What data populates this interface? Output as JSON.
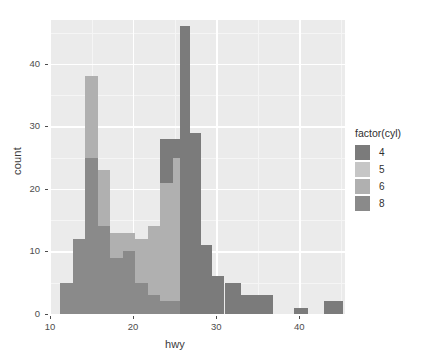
{
  "chart_data": {
    "type": "bar",
    "subtype": "stacked-histogram",
    "title": "",
    "xlabel": "hwy",
    "ylabel": "count",
    "xlim": [
      10.0,
      45.5
    ],
    "ylim": [
      0,
      47
    ],
    "xticks": [
      10,
      20,
      30,
      40
    ],
    "yticks": [
      0,
      10,
      20,
      30,
      40
    ],
    "grid": true,
    "legend": {
      "title": "factor(cyl)",
      "position": "right",
      "entries": [
        {
          "label": "4",
          "color": "#7b7b7b"
        },
        {
          "label": "5",
          "color": "#c6c6c6"
        },
        {
          "label": "6",
          "color": "#b0b0b0"
        },
        {
          "label": "8",
          "color": "#8a8a8a"
        }
      ]
    },
    "binwidth": 1.5,
    "bins": [
      {
        "x0": 11.25,
        "x1": 12.75,
        "values": {
          "4": 0,
          "5": 0,
          "6": 0,
          "8": 5
        }
      },
      {
        "x0": 12.75,
        "x1": 14.25,
        "values": {
          "4": 0,
          "5": 0,
          "6": 0,
          "8": 12
        }
      },
      {
        "x0": 14.25,
        "x1": 15.75,
        "values": {
          "4": 0,
          "5": 0,
          "6": 0,
          "8": 25
        }
      },
      {
        "x0": 15.75,
        "x1": 17.25,
        "values": {
          "4": 0,
          "5": 0,
          "6": 13,
          "8": 25
        }
      },
      {
        "x0": 17.25,
        "x1": 18.75,
        "values": {
          "4": 0,
          "5": 0,
          "6": 9,
          "8": 14
        }
      },
      {
        "x0": 18.75,
        "x1": 20.25,
        "values": {
          "4": 0,
          "5": 0,
          "6": 10,
          "8": 4
        }
      },
      {
        "x0": 20.25,
        "x1": 21.75,
        "values": {
          "4": 0,
          "5": 0,
          "6": 9,
          "8": 4
        }
      },
      {
        "x0": 21.75,
        "x1": 23.25,
        "values": {
          "4": 0,
          "5": 0,
          "6": 9,
          "8": 5
        }
      },
      {
        "x0": 23.25,
        "x1": 24.75,
        "values": {
          "4": 0,
          "5": 0,
          "6": 11,
          "8": 3
        }
      },
      {
        "x0": 24.75,
        "x1": 26.25,
        "values": {
          "4": 0,
          "5": 0,
          "6": 19,
          "8": 2
        }
      },
      {
        "x0": 25.6,
        "x1": 26.9,
        "values": {
          "4": 46,
          "5": 0,
          "6": 0,
          "8": 0
        }
      },
      {
        "x0": 26.25,
        "x1": 27.75,
        "values": {
          "4": 0,
          "5": 0,
          "6": 23,
          "8": 2
        }
      },
      {
        "x0": 27.75,
        "x1": 29.25,
        "values": {
          "4": 0,
          "5": 0,
          "6": 8,
          "8": 0
        }
      },
      {
        "x0": 29.25,
        "x1": 30.75,
        "values": {
          "4": 0,
          "5": 0,
          "6": 6,
          "8": 0
        }
      },
      {
        "x0": 30.75,
        "x1": 32.25,
        "values": {
          "4": 0,
          "5": 0,
          "6": 5,
          "8": 0
        }
      },
      {
        "x0": 32.25,
        "x1": 33.75,
        "values": {
          "4": 0,
          "5": 0,
          "6": 3,
          "8": 0
        }
      },
      {
        "x0": 33.75,
        "x1": 36.75,
        "values": {
          "4": 0,
          "5": 0,
          "6": 3,
          "8": 0
        }
      },
      {
        "x0": 39.4,
        "x1": 41.0,
        "values": {
          "4": 1,
          "5": 0,
          "6": 0,
          "8": 0
        }
      },
      {
        "x0": 43.0,
        "x1": 45.0,
        "values": {
          "4": 2,
          "5": 0,
          "6": 0,
          "8": 0
        }
      }
    ],
    "visual_bars": [
      {
        "x0": 11.25,
        "x1": 12.75,
        "bottom": 0,
        "top": 5,
        "series": "8"
      },
      {
        "x0": 12.75,
        "x1": 14.25,
        "bottom": 0,
        "top": 12,
        "series": "8"
      },
      {
        "x0": 14.25,
        "x1": 15.75,
        "bottom": 0,
        "top": 25,
        "series": "8"
      },
      {
        "x0": 14.25,
        "x1": 15.75,
        "bottom": 25,
        "top": 38,
        "series": "6"
      },
      {
        "x0": 15.75,
        "x1": 17.25,
        "bottom": 0,
        "top": 14,
        "series": "8"
      },
      {
        "x0": 15.75,
        "x1": 17.25,
        "bottom": 14,
        "top": 23,
        "series": "6"
      },
      {
        "x0": 17.25,
        "x1": 18.75,
        "bottom": 0,
        "top": 9,
        "series": "8"
      },
      {
        "x0": 17.25,
        "x1": 18.75,
        "bottom": 9,
        "top": 13,
        "series": "6"
      },
      {
        "x0": 18.75,
        "x1": 20.25,
        "bottom": 0,
        "top": 10,
        "series": "8"
      },
      {
        "x0": 18.75,
        "x1": 20.25,
        "bottom": 10,
        "top": 13,
        "series": "6"
      },
      {
        "x0": 20.25,
        "x1": 21.75,
        "bottom": 0,
        "top": 5,
        "series": "8"
      },
      {
        "x0": 20.25,
        "x1": 21.75,
        "bottom": 5,
        "top": 12,
        "series": "6"
      },
      {
        "x0": 21.75,
        "x1": 23.25,
        "bottom": 0,
        "top": 3,
        "series": "8"
      },
      {
        "x0": 21.75,
        "x1": 23.25,
        "bottom": 3,
        "top": 14,
        "series": "6"
      },
      {
        "x0": 23.25,
        "x1": 24.75,
        "bottom": 0,
        "top": 2,
        "series": "8"
      },
      {
        "x0": 23.25,
        "x1": 24.75,
        "bottom": 2,
        "top": 21,
        "series": "6"
      },
      {
        "x0": 23.25,
        "x1": 24.75,
        "bottom": 21,
        "top": 28,
        "series": "4"
      },
      {
        "x0": 24.75,
        "x1": 25.6,
        "bottom": 0,
        "top": 2,
        "series": "8"
      },
      {
        "x0": 24.75,
        "x1": 25.6,
        "bottom": 2,
        "top": 25,
        "series": "6"
      },
      {
        "x0": 24.75,
        "x1": 25.6,
        "bottom": 25,
        "top": 28,
        "series": "4"
      },
      {
        "x0": 25.6,
        "x1": 26.9,
        "bottom": 0,
        "top": 46,
        "series": "4"
      },
      {
        "x0": 26.9,
        "x1": 28.2,
        "bottom": 0,
        "top": 29,
        "series": "4"
      },
      {
        "x0": 28.2,
        "x1": 29.5,
        "bottom": 0,
        "top": 11,
        "series": "4"
      },
      {
        "x0": 29.5,
        "x1": 31.0,
        "bottom": 0,
        "top": 6,
        "series": "4"
      },
      {
        "x0": 31.0,
        "x1": 33.0,
        "bottom": 0,
        "top": 5,
        "series": "4"
      },
      {
        "x0": 33.0,
        "x1": 36.8,
        "bottom": 0,
        "top": 3,
        "series": "4"
      },
      {
        "x0": 39.4,
        "x1": 41.0,
        "bottom": 0,
        "top": 1,
        "series": "4"
      },
      {
        "x0": 43.0,
        "x1": 45.2,
        "bottom": 0,
        "top": 2,
        "series": "4"
      }
    ]
  },
  "theme": {
    "panel_background": "#ebebeb",
    "grid_major_color": "#ffffff",
    "grid_minor_color": "#f5f5f5",
    "text_color": "#4d4d4d"
  }
}
